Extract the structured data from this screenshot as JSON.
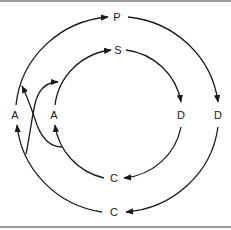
{
  "diagram": {
    "type": "cycle-diagram",
    "colors": {
      "stroke": "#1a1a1a",
      "border": "#9a9a9a",
      "background": "#ffffff"
    },
    "outer_cycle": {
      "nodes": [
        {
          "id": "outer-top",
          "label": "P"
        },
        {
          "id": "outer-right",
          "label": "D"
        },
        {
          "id": "outer-bottom",
          "label": "C"
        },
        {
          "id": "outer-left",
          "label": "A"
        }
      ],
      "direction": "clockwise"
    },
    "inner_cycle": {
      "nodes": [
        {
          "id": "inner-top",
          "label": "S"
        },
        {
          "id": "inner-right",
          "label": "D"
        },
        {
          "id": "inner-bottom",
          "label": "C"
        },
        {
          "id": "inner-left",
          "label": "A"
        }
      ],
      "direction": "clockwise"
    },
    "cross_links": [
      {
        "from": "outer-bottom-left-arc",
        "to": "inner-top-left-arc"
      },
      {
        "from": "inner-bottom-left-arc",
        "to": "outer-top-left-arc"
      }
    ]
  }
}
